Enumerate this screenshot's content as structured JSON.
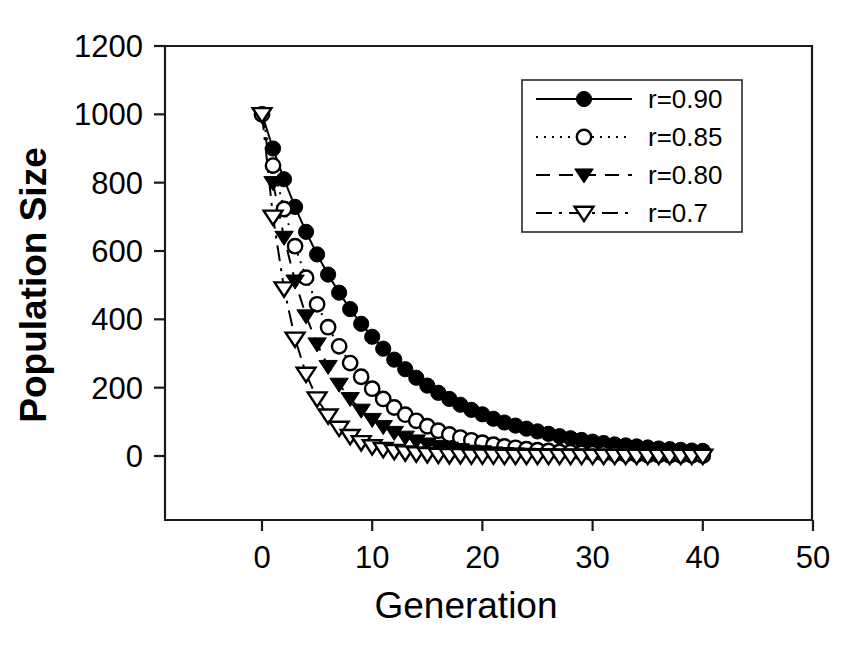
{
  "chart_data": {
    "type": "line",
    "title": "",
    "subtitle": "",
    "xlabel": "Generation",
    "ylabel": "Population Size",
    "xlim": [
      -10,
      50
    ],
    "ylim": [
      -130,
      1200
    ],
    "xticks": [
      "0",
      "10",
      "20",
      "30",
      "40",
      "50"
    ],
    "xtick_values": [
      0,
      10,
      20,
      30,
      40,
      50
    ],
    "yticks": [
      "0",
      "200",
      "400",
      "600",
      "800",
      "1000",
      "1200"
    ],
    "ytick_values": [
      0,
      200,
      400,
      600,
      800,
      1000,
      1200
    ],
    "grid": false,
    "legend_position": "top-right",
    "x": [
      0,
      1,
      2,
      3,
      4,
      5,
      6,
      7,
      8,
      9,
      10,
      11,
      12,
      13,
      14,
      15,
      16,
      17,
      18,
      19,
      20,
      21,
      22,
      23,
      24,
      25,
      26,
      27,
      28,
      29,
      30,
      31,
      32,
      33,
      34,
      35,
      36,
      37,
      38,
      39,
      40
    ],
    "series": [
      {
        "name": "r=0.90",
        "rate": 0.9,
        "initial": 1000,
        "line_style": "solid",
        "marker": "filled-circle",
        "color": "#000000",
        "values": [
          1000,
          900,
          810,
          729,
          656,
          590,
          531,
          478,
          430,
          387,
          349,
          314,
          282,
          254,
          229,
          206,
          185,
          167,
          150,
          135,
          122,
          109,
          98,
          89,
          80,
          72,
          65,
          58,
          52,
          47,
          42,
          38,
          34,
          31,
          28,
          25,
          22,
          20,
          18,
          16,
          15
        ]
      },
      {
        "name": "r=0.85",
        "rate": 0.85,
        "initial": 1000,
        "line_style": "dotted",
        "marker": "open-circle",
        "color": "#000000",
        "values": [
          1000,
          850,
          723,
          614,
          522,
          444,
          377,
          321,
          272,
          232,
          197,
          167,
          142,
          121,
          103,
          87,
          74,
          63,
          54,
          46,
          39,
          33,
          28,
          24,
          20,
          17,
          15,
          12,
          11,
          9,
          8,
          7,
          6,
          5,
          4,
          3,
          3,
          2,
          2,
          2,
          1
        ]
      },
      {
        "name": "r=0.80",
        "rate": 0.8,
        "initial": 1000,
        "line_style": "dashed",
        "marker": "filled-triangle-down",
        "color": "#000000",
        "values": [
          1000,
          800,
          640,
          512,
          410,
          328,
          262,
          210,
          168,
          134,
          107,
          86,
          69,
          55,
          44,
          35,
          28,
          23,
          18,
          14,
          12,
          9,
          7,
          6,
          5,
          4,
          3,
          2,
          2,
          2,
          1,
          1,
          1,
          1,
          1,
          0,
          0,
          0,
          0,
          0,
          0
        ]
      },
      {
        "name": "r=0.7",
        "rate": 0.7,
        "initial": 1000,
        "line_style": "dash-dot",
        "marker": "open-triangle-down",
        "color": "#000000",
        "values": [
          1000,
          700,
          490,
          343,
          240,
          168,
          118,
          82,
          58,
          40,
          28,
          20,
          14,
          10,
          7,
          5,
          3,
          2,
          2,
          1,
          1,
          1,
          0,
          0,
          0,
          0,
          0,
          0,
          0,
          0,
          0,
          0,
          0,
          0,
          0,
          0,
          0,
          0,
          0,
          0,
          0
        ]
      }
    ],
    "legend_entries": [
      "r=0.90",
      "r=0.85",
      "r=0.80",
      "r=0.7"
    ]
  },
  "axes": {
    "x_title": "Generation",
    "y_title": "Population Size"
  },
  "colors": {
    "foreground": "#000000",
    "background": "#ffffff",
    "axis": "#1a1a1a"
  }
}
